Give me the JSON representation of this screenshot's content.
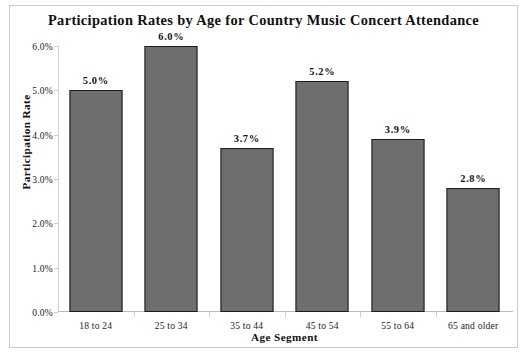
{
  "chart_data": {
    "type": "bar",
    "title": "Participation Rates by Age for Country Music Concert Attendance",
    "xlabel": "Age Segment",
    "ylabel": "Participation Rate",
    "categories": [
      "18 to 24",
      "25 to 34",
      "35 to 44",
      "45 to 54",
      "55 to 64",
      "65 and older"
    ],
    "values": [
      5.0,
      6.0,
      3.7,
      5.2,
      3.9,
      2.8
    ],
    "value_labels": [
      "5.0%",
      "6.0%",
      "3.7%",
      "5.2%",
      "3.9%",
      "2.8%"
    ],
    "ylim": [
      0,
      6
    ],
    "ytick_values": [
      0.0,
      1.0,
      2.0,
      3.0,
      4.0,
      5.0,
      6.0
    ],
    "ytick_labels": [
      "0.0%",
      "1.0%",
      "2.0%",
      "3.0%",
      "4.0%",
      "5.0%",
      "6.0%"
    ],
    "grid": false,
    "legend": false,
    "series": [
      {
        "name": "Participation Rate",
        "values": [
          5.0,
          6.0,
          3.7,
          5.2,
          3.9,
          2.8
        ]
      }
    ],
    "colors": {
      "bar_fill": "#6e6e6e",
      "bar_outline": "#1c1c1c",
      "axis": "#cfcfd4",
      "text": "#111111",
      "background": "#ffffff",
      "frame_border": "#c9c9cf"
    }
  }
}
